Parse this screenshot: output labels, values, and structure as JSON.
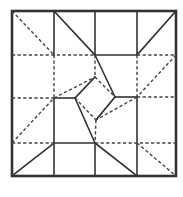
{
  "diagram": {
    "type": "origami-crease-pattern",
    "colors": {
      "background": "#ffffff",
      "line": "#333333"
    },
    "border": {
      "x1": 12,
      "y1": 11,
      "x2": 176,
      "y2": 176
    },
    "mountain_folds": [
      [
        54,
        11,
        54,
        55
      ],
      [
        95,
        11,
        95,
        55
      ],
      [
        137,
        11,
        137,
        55
      ],
      [
        95,
        55,
        137,
        55
      ],
      [
        54,
        11,
        95,
        55
      ],
      [
        95,
        55,
        115,
        97
      ],
      [
        176,
        11,
        137,
        55
      ],
      [
        137,
        97,
        137,
        176
      ],
      [
        115,
        97,
        137,
        97
      ],
      [
        75,
        98,
        95,
        77
      ],
      [
        115,
        97,
        96,
        120
      ],
      [
        54,
        98,
        75,
        98
      ],
      [
        54,
        98,
        54,
        176
      ],
      [
        75,
        98,
        95,
        143
      ],
      [
        54,
        143,
        95,
        143
      ],
      [
        54,
        143,
        12,
        176
      ],
      [
        95,
        143,
        95,
        176
      ],
      [
        95,
        143,
        137,
        176
      ]
    ],
    "valley_folds": [
      [
        12,
        11,
        54,
        55
      ],
      [
        12,
        55,
        95,
        55
      ],
      [
        137,
        55,
        176,
        55
      ],
      [
        54,
        55,
        54,
        98
      ],
      [
        95,
        55,
        95,
        77
      ],
      [
        54,
        98,
        95,
        77
      ],
      [
        95,
        77,
        115,
        97
      ],
      [
        176,
        55,
        137,
        97
      ],
      [
        12,
        98,
        54,
        98
      ],
      [
        137,
        97,
        176,
        97
      ],
      [
        137,
        97,
        96,
        120
      ],
      [
        75,
        98,
        96,
        120
      ],
      [
        96,
        120,
        95,
        143
      ],
      [
        12,
        143,
        54,
        98
      ],
      [
        12,
        143,
        54,
        143
      ],
      [
        95,
        143,
        176,
        143
      ],
      [
        137,
        143,
        176,
        176
      ],
      [
        137,
        55,
        137,
        97
      ]
    ]
  }
}
